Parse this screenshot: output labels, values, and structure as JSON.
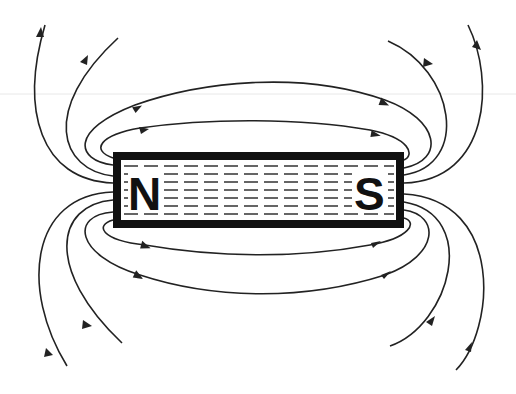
{
  "diagram": {
    "type": "physics-diagram",
    "magnet": {
      "north_label": "N",
      "south_label": "S",
      "border_color": "#111111",
      "fill_color": "#ffffff",
      "interior_pattern": "dashed horizontal lines"
    },
    "field_lines": {
      "color": "#222222",
      "direction": "from N (left) to S (right)",
      "closed_loops_above": 2,
      "closed_loops_below": 2,
      "open_lines_left_top": 2,
      "open_lines_left_bottom": 2,
      "open_lines_right_top": 2,
      "open_lines_right_bottom": 2,
      "arrowheads": 12
    }
  }
}
